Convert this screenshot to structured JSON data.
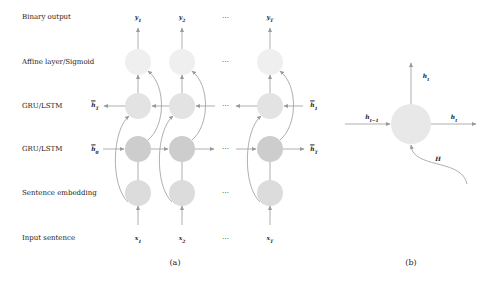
{
  "figure_a": {
    "caption": "(a)",
    "row_labels": {
      "binary_output": "Binary output",
      "affine": "Affine layer/Sigmoid",
      "gru_backward": "GRU/LSTM",
      "gru_forward": "GRU/LSTM",
      "embedding": "Sentence embedding",
      "input": "Input sentence"
    },
    "outputs": [
      "y",
      "y",
      "y"
    ],
    "output_subs": [
      "1",
      "2",
      "T"
    ],
    "inputs": [
      "x",
      "x",
      "x"
    ],
    "input_subs": [
      "1",
      "2",
      "T"
    ],
    "backward_left_label": "h",
    "backward_left_sub": "T",
    "backward_right_label": "h",
    "backward_right_sub": "1",
    "forward_left_label": "h",
    "forward_left_sub": "0",
    "forward_right_label": "h",
    "forward_right_sub": "T",
    "ellipsis": "⋯"
  },
  "figure_b": {
    "caption": "(b)",
    "input_label": "h",
    "input_sub": "t−1",
    "output_right_label": "h",
    "output_right_sub": "t",
    "output_up_label": "h",
    "output_up_sub": "t",
    "context_label": "H"
  },
  "colors": {
    "affine_node": "#eeeeee",
    "gru_backward_node": "#e2e2e2",
    "gru_forward_node": "#cccccc",
    "embedding_node": "#dcdcdc",
    "cell_node": "#e6e6e6",
    "arrow": "#999999"
  }
}
